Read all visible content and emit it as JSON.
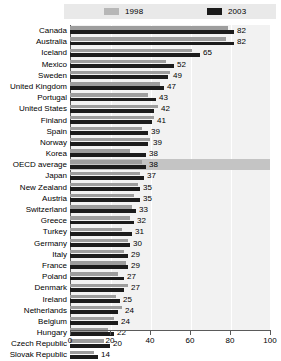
{
  "legend": {
    "entries": [
      {
        "label": "1998",
        "color": "#b7b7b7"
      },
      {
        "label": "2003",
        "color": "#1a1a1a"
      }
    ]
  },
  "axis": {
    "ticks": [
      "0",
      "20",
      "40",
      "60",
      "80",
      "100"
    ]
  },
  "chart_data": {
    "type": "bar",
    "orientation": "horizontal",
    "title": "",
    "xlabel": "",
    "ylabel": "",
    "xlim": [
      0,
      100
    ],
    "grid": true,
    "legend_position": "top",
    "highlight_category": "OECD average",
    "categories": [
      "Canada",
      "Australia",
      "Iceland",
      "Mexico",
      "Sweden",
      "United Kingdom",
      "Portugal",
      "United States",
      "Finland",
      "Spain",
      "Norway",
      "Korea",
      "OECD average",
      "Japan",
      "New Zealand",
      "Austria",
      "Switzerland",
      "Greece",
      "Turkey",
      "Germany",
      "Italy",
      "France",
      "Poland",
      "Denmark",
      "Ireland",
      "Netherlands",
      "Belgium",
      "Hungary",
      "Czech Republic",
      "Slovak Republic"
    ],
    "series": [
      {
        "name": "1998",
        "color": "#9d9d9d",
        "values": [
          79,
          78,
          61,
          48,
          50,
          45,
          39,
          44,
          42,
          36,
          40,
          30,
          36,
          35,
          34,
          32,
          31,
          30,
          26,
          29,
          27,
          28,
          24,
          29,
          23,
          26,
          22,
          19,
          17,
          12
        ]
      },
      {
        "name": "2003",
        "color": "#1c1c1c",
        "values": [
          82,
          82,
          65,
          52,
          49,
          47,
          43,
          42,
          41,
          39,
          39,
          38,
          38,
          37,
          35,
          35,
          33,
          32,
          31,
          30,
          29,
          29,
          27,
          27,
          25,
          24,
          24,
          22,
          20,
          14
        ]
      }
    ],
    "value_labels": [
      82,
      82,
      65,
      52,
      49,
      47,
      43,
      42,
      41,
      39,
      39,
      38,
      38,
      37,
      35,
      35,
      33,
      32,
      31,
      30,
      29,
      29,
      27,
      27,
      25,
      24,
      24,
      22,
      20,
      14
    ]
  }
}
